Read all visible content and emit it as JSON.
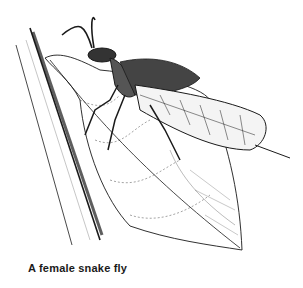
{
  "caption": "A female snake fly",
  "colors": {
    "ink": "#1a1a1a",
    "background": "#ffffff"
  }
}
